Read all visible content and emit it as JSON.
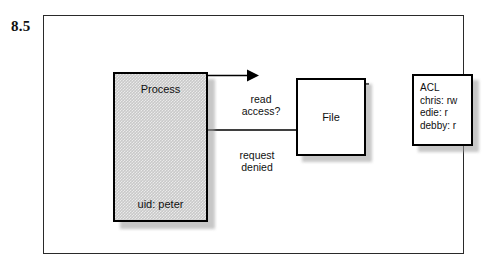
{
  "figure": {
    "number": "8.5"
  },
  "diagram": {
    "type": "access-control-flow",
    "nodes": [
      {
        "id": "process",
        "name": "Process",
        "title": "Process",
        "detail": "uid: peter",
        "fill": "#c9c9c9",
        "stroke": "#000000",
        "shape": "rectangle"
      },
      {
        "id": "file",
        "name": "File",
        "title": "File",
        "fill": "#ffffff",
        "stroke": "#000000",
        "shape": "rectangle"
      },
      {
        "id": "acl",
        "name": "ACL",
        "title": "ACL",
        "entries": [
          "chris: rw",
          "edie: r",
          "debby: r"
        ],
        "fill": "#ffffff",
        "stroke": "#000000",
        "shape": "rectangle"
      }
    ],
    "edges": [
      {
        "id": "request",
        "from": "process",
        "to": "file",
        "label_line1": "read",
        "label_line2": "access?",
        "direction": "right",
        "arrowhead": true
      },
      {
        "id": "response",
        "from": "file",
        "to": "process",
        "label_line1": "request",
        "label_line2": "denied",
        "direction": "left",
        "arrowhead": true
      },
      {
        "id": "file-acl-link",
        "from": "file",
        "to": "acl",
        "label_line1": "",
        "label_line2": "",
        "direction": "none",
        "arrowhead": false
      }
    ]
  },
  "colors": {
    "frame_border": "#2a2a2a",
    "node_border": "#000000",
    "process_fill": "#c9c9c9",
    "shadow": "#9a9a9a",
    "text": "#101010",
    "background": "#ffffff"
  }
}
